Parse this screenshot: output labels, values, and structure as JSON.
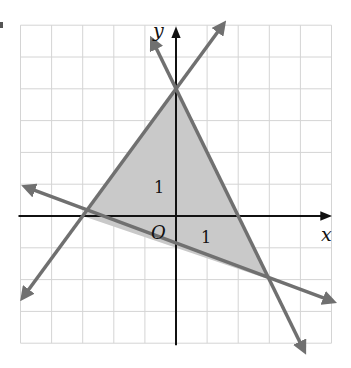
{
  "figure": {
    "type": "coordinate-plane-system-of-inequalities",
    "x_axis_label": "x",
    "y_axis_label": "y",
    "origin_label": "O",
    "x_tick_label": "1",
    "y_tick_label": "1",
    "x_range": [
      -5,
      5
    ],
    "y_range": [
      -4,
      6
    ],
    "grid_step": 1,
    "colors": {
      "grid": "#d4d4d4",
      "axes": "#111111",
      "boundary_lines": "#707070",
      "shaded_region": "#c9c9c9"
    },
    "shaded_region_vertices": [
      [
        -3,
        0
      ],
      [
        0,
        4
      ],
      [
        3,
        -2
      ]
    ],
    "boundary_lines": [
      {
        "name": "line-a",
        "equation": "y = 4/3 x + 4",
        "through": [
          [
            -3,
            0
          ],
          [
            0,
            4
          ]
        ],
        "arrow_ends": [
          [
            -4.9,
            -2.53
          ],
          [
            1.5,
            6
          ]
        ]
      },
      {
        "name": "line-b",
        "equation": "y = -2x + 4",
        "through": [
          [
            0,
            4
          ],
          [
            3,
            -2
          ]
        ],
        "arrow_ends": [
          [
            -0.75,
            5.5
          ],
          [
            4.1,
            -4.2
          ]
        ]
      },
      {
        "name": "line-c",
        "equation": "y = -1/3 x - 1",
        "through": [
          [
            -3,
            0
          ],
          [
            3,
            -2
          ]
        ],
        "arrow_ends": [
          [
            -4.8,
            0.9
          ],
          [
            5.0,
            -2.67
          ]
        ]
      }
    ]
  }
}
